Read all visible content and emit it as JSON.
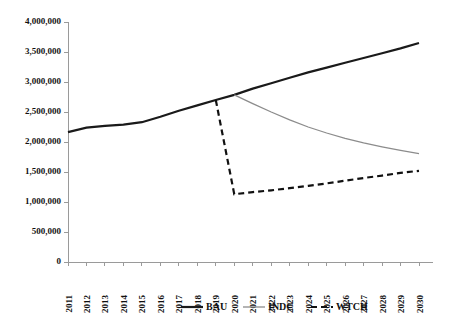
{
  "chart_data": {
    "type": "line",
    "title": "",
    "subtitle": "",
    "xlabel": "",
    "ylabel": "",
    "x": [
      2011,
      2012,
      2013,
      2014,
      2015,
      2016,
      2017,
      2018,
      2019,
      2020,
      2021,
      2022,
      2023,
      2024,
      2025,
      2026,
      2027,
      2028,
      2029,
      2030
    ],
    "categories": [
      "2011",
      "2012",
      "2013",
      "2014",
      "2015",
      "2016",
      "2017",
      "2018",
      "2019",
      "2020",
      "2021",
      "2022",
      "2023",
      "2024",
      "2025",
      "2026",
      "2027",
      "2028",
      "2029",
      "2030"
    ],
    "xlim": [
      2011,
      2030
    ],
    "ylim": [
      0,
      4000000
    ],
    "yticks": [
      0,
      500000,
      1000000,
      1500000,
      2000000,
      2500000,
      3000000,
      3500000,
      4000000
    ],
    "ytick_labels": [
      "0",
      "500,000",
      "1,000,000",
      "1,500,000",
      "2,000,000",
      "2,500,000",
      "3,000,000",
      "3,500,000",
      "4,000,000"
    ],
    "grid": false,
    "legend_position": "bottom",
    "series": [
      {
        "name": "BAU",
        "style": "solid",
        "color": "#1a1a1a",
        "width": 2.2,
        "values": [
          2165000,
          2240000,
          2270000,
          2290000,
          2330000,
          2420000,
          2520000,
          2610000,
          2700000,
          2785000,
          2890000,
          2980000,
          3070000,
          3160000,
          3240000,
          3320000,
          3400000,
          3480000,
          3560000,
          3650000
        ]
      },
      {
        "name": "INDC",
        "style": "solid",
        "color": "#8c8c8c",
        "width": 1.3,
        "values": [
          null,
          null,
          null,
          null,
          null,
          null,
          null,
          null,
          null,
          2785000,
          2640000,
          2500000,
          2370000,
          2250000,
          2150000,
          2060000,
          1985000,
          1920000,
          1860000,
          1805000
        ]
      },
      {
        "name": "WTCH",
        "style": "dashed",
        "color": "#111111",
        "width": 2.2,
        "values": [
          null,
          null,
          null,
          null,
          null,
          null,
          null,
          null,
          2700000,
          1130000,
          1165000,
          1195000,
          1230000,
          1270000,
          1310000,
          1355000,
          1400000,
          1440000,
          1485000,
          1520000
        ]
      }
    ],
    "legend": [
      {
        "label": "BAU",
        "style": "solid",
        "color": "#1a1a1a"
      },
      {
        "label": "INDC",
        "style": "solid",
        "color": "#8c8c8c"
      },
      {
        "label": "WTCH",
        "style": "dashed",
        "color": "#111111"
      }
    ]
  }
}
